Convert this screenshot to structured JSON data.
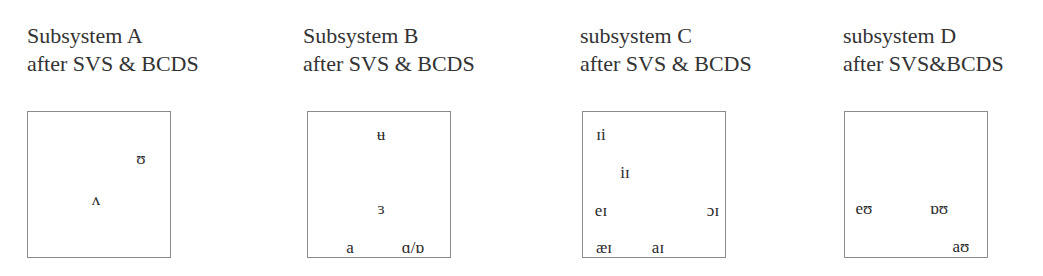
{
  "panels": [
    {
      "id": "A",
      "title_line1": "Subsystem A",
      "title_line2": "after SVS & BCDS",
      "symbols": [
        {
          "text": "ʊ",
          "x": 113,
          "y": 46
        },
        {
          "text": "ʌ",
          "x": 68,
          "y": 87
        }
      ]
    },
    {
      "id": "B",
      "title_line1": "Subsystem B",
      "title_line2": "after SVS & BCDS",
      "symbols": [
        {
          "text": "ʉ",
          "x": 73,
          "y": 22
        },
        {
          "text": "ɜ",
          "x": 73,
          "y": 96
        },
        {
          "text": "a",
          "x": 42,
          "y": 135
        },
        {
          "text": "ɑ/ɒ",
          "x": 105,
          "y": 135
        }
      ]
    },
    {
      "id": "C",
      "title_line1": "subsystem C",
      "title_line2": "after SVS & BCDS",
      "symbols": [
        {
          "text": "ɪi",
          "x": 18,
          "y": 22
        },
        {
          "text": "iɪ",
          "x": 42,
          "y": 60
        },
        {
          "text": "eɪ",
          "x": 18,
          "y": 98
        },
        {
          "text": "ɔɪ",
          "x": 130,
          "y": 98
        },
        {
          "text": "æɪ",
          "x": 21,
          "y": 135
        },
        {
          "text": "aɪ",
          "x": 75,
          "y": 135
        }
      ]
    },
    {
      "id": "D",
      "title_line1": "subsystem D",
      "title_line2": "after SVS&BCDS",
      "symbols": [
        {
          "text": "eʊ",
          "x": 19,
          "y": 96
        },
        {
          "text": "ɒʊ",
          "x": 94,
          "y": 96
        },
        {
          "text": "aʊ",
          "x": 116,
          "y": 134
        }
      ]
    }
  ],
  "layout": {
    "title_left": [
      27,
      303,
      580,
      843
    ],
    "box_left": [
      27,
      307,
      582,
      844
    ]
  }
}
